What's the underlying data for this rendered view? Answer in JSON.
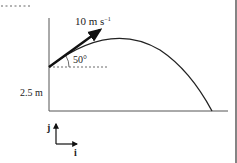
{
  "diagram": {
    "type": "projectile-motion",
    "velocity_label": "10 m s",
    "velocity_exponent": "−1",
    "angle_label": "50°",
    "height_label": "2.5 m",
    "unit_j": "j",
    "unit_i": "i",
    "colors": {
      "ink": "#222222",
      "axis": "#555555",
      "background": "#ffffff"
    }
  }
}
